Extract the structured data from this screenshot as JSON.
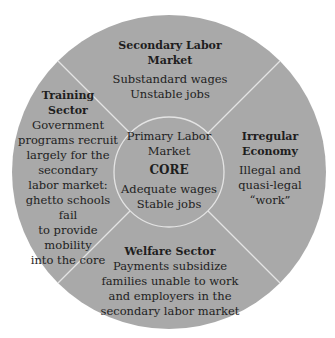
{
  "colors": {
    "disc": "#a9a9a9",
    "lines": "#e4e4e4",
    "text": "#1e1e1e",
    "background": "#ffffff"
  },
  "diagram": {
    "outer_circle": {
      "cx": 169,
      "cy": 172,
      "r": 157
    },
    "inner_circle": {
      "cx": 169,
      "cy": 172,
      "r": 55
    },
    "sectors": {
      "top": {
        "title": "Secondary Labor Market",
        "title_lines": [
          "Secondary Labor",
          "Market"
        ],
        "body_lines": [
          "Substandard wages",
          "Unstable jobs"
        ]
      },
      "left": {
        "title": "Training Sector",
        "title_lines": [
          "Training",
          "Sector"
        ],
        "body_lines": [
          "Government",
          "programs recruit",
          "largely for the",
          "secondary",
          "labor market:",
          "ghetto schools fail",
          "to provide mobility",
          "into the core"
        ]
      },
      "right": {
        "title": "Irregular Economy",
        "title_lines": [
          "Irregular",
          "Economy"
        ],
        "body_lines": [
          "Illegal and",
          "quasi-legal",
          "“work”"
        ]
      },
      "bottom": {
        "title": "Welfare Sector",
        "title_lines": [
          "Welfare Sector"
        ],
        "body_lines": [
          "Payments subsidize",
          "families unable to work",
          "and employers in the",
          "secondary labor market"
        ]
      }
    },
    "core": {
      "heading_lines": [
        "Primary Labor",
        "Market"
      ],
      "label": "CORE",
      "body_lines": [
        "Adequate wages",
        "Stable jobs"
      ]
    }
  }
}
